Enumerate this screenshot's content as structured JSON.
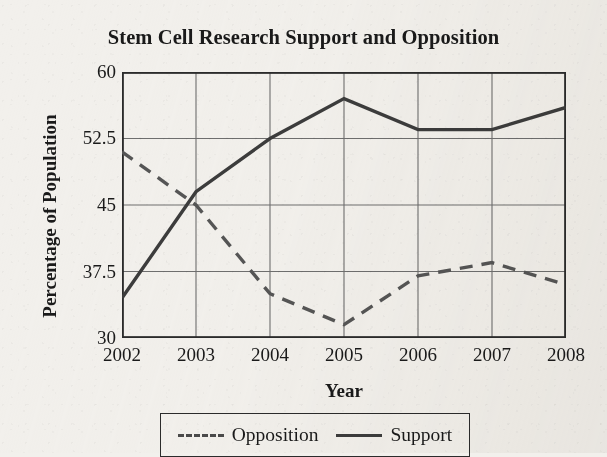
{
  "chart_data": {
    "type": "line",
    "title": "Stem Cell Research Support and Opposition",
    "xlabel": "Year",
    "ylabel": "Percentage of Population",
    "x": [
      2002,
      2003,
      2004,
      2005,
      2006,
      2007,
      2008
    ],
    "categories": [
      "2002",
      "2003",
      "2004",
      "2005",
      "2006",
      "2007",
      "2008"
    ],
    "series": [
      {
        "name": "Opposition",
        "style": "dashed",
        "color": "#555555",
        "values": [
          51,
          45,
          35,
          31.5,
          37,
          38.5,
          36
        ]
      },
      {
        "name": "Support",
        "style": "solid",
        "color": "#3c3c3c",
        "values": [
          34.5,
          46.5,
          52.5,
          57,
          53.5,
          53.5,
          56
        ]
      }
    ],
    "xlim": [
      2002,
      2008
    ],
    "ylim": [
      30,
      60
    ],
    "yticks": [
      30,
      37.5,
      45,
      52.5,
      60
    ],
    "ytick_labels": [
      "30",
      "37.5",
      "45",
      "52.5",
      "60"
    ],
    "xticks": [
      2002,
      2003,
      2004,
      2005,
      2006,
      2007,
      2008
    ],
    "xtick_labels": [
      "2002",
      "2003",
      "2004",
      "2005",
      "2006",
      "2007",
      "2008"
    ],
    "grid": true,
    "grid_axis": "both",
    "legend_position": "bottom-center",
    "legend_entries": [
      "Opposition",
      "Support"
    ],
    "frame": true
  },
  "colors": {
    "background": "#f2f0ec",
    "axis": "#2b2b2b",
    "grid": "#6b6b6b",
    "support_line": "#3c3c3c",
    "opposition_line": "#555555",
    "text": "#1a1a1a"
  }
}
